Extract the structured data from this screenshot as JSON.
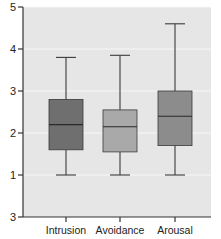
{
  "chart_data": {
    "type": "box",
    "title": "",
    "xlabel": "",
    "ylabel": "",
    "ylim": [
      0,
      5
    ],
    "y_ticks": [
      {
        "value": 5,
        "label": "5"
      },
      {
        "value": 4,
        "label": "4"
      },
      {
        "value": 3,
        "label": "3"
      },
      {
        "value": 2,
        "label": "2"
      },
      {
        "value": 1,
        "label": "1"
      },
      {
        "value": 0,
        "label": "3"
      }
    ],
    "grid": true,
    "legend": null,
    "categories": [
      "Intrusion",
      "Avoidance",
      "Arousal"
    ],
    "series": [
      {
        "name": "Intrusion",
        "whisker_low": 1.0,
        "q1": 1.6,
        "median": 2.2,
        "q3": 2.8,
        "whisker_high": 3.8,
        "color": "#6f6f6f"
      },
      {
        "name": "Avoidance",
        "whisker_low": 1.0,
        "q1": 1.55,
        "median": 2.15,
        "q3": 2.55,
        "whisker_high": 3.85,
        "color": "#a9a9a9"
      },
      {
        "name": "Arousal",
        "whisker_low": 1.0,
        "q1": 1.7,
        "median": 2.4,
        "q3": 3.0,
        "whisker_high": 4.6,
        "color": "#8c8c8c"
      }
    ]
  },
  "colors": {
    "plot_background": "#e6e6e6",
    "gridline": "#f7f7f7",
    "axis": "#333333",
    "box_stroke": "#3a3a3a"
  }
}
